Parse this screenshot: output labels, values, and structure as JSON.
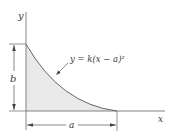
{
  "figure": {
    "axis_labels": {
      "x": "x",
      "y": "y"
    },
    "equation": "y = k(x − a)²",
    "dimensions": {
      "height": "b",
      "width": "a"
    },
    "colors": {
      "fill": "#e9e9e9",
      "stroke": "#555555",
      "text": "#3a3a3a"
    }
  }
}
